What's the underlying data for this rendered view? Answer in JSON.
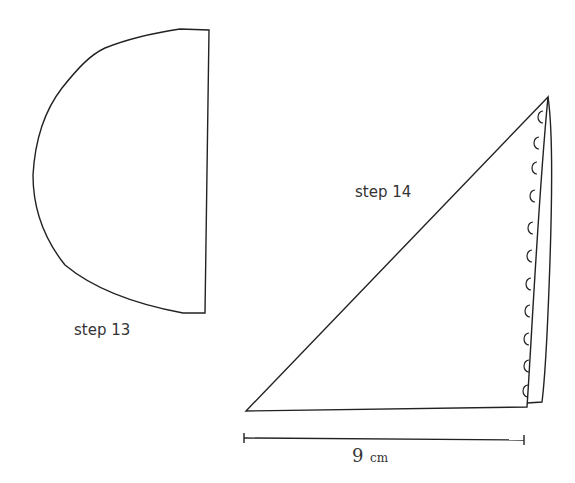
{
  "figures": [
    {
      "id": "step13",
      "label": "step 13",
      "shape": "half-circle pattern piece"
    },
    {
      "id": "step14",
      "label": "step 14",
      "shape": "folded triangle with scalloped edge",
      "scallop_count": 11
    }
  ],
  "measurement": {
    "value": "9",
    "unit": "cm"
  },
  "colors": {
    "stroke": "#222222",
    "background": "#ffffff"
  }
}
